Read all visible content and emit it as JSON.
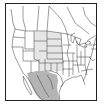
{
  "map": {
    "title": "Range map",
    "region": "North America",
    "legend": [
      {
        "name": "light-range",
        "color": "#e6e6e6"
      },
      {
        "name": "dark-range",
        "color": "#b4b4b4"
      }
    ],
    "colors": {
      "background": "#ffffff",
      "border": "#222222",
      "lines": "#3a3a3a",
      "light_range": "#e6e6e6",
      "dark_range": "#b4b4b4"
    }
  }
}
